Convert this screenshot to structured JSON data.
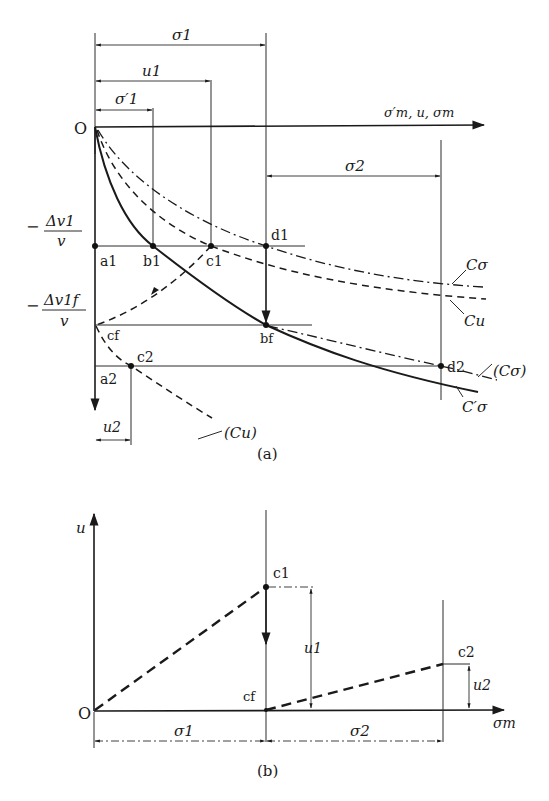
{
  "figure_a": {
    "caption": "(a)",
    "origin_label": "O",
    "x_axis_label": "σ′m, u, σm",
    "dimensions": {
      "sigma1": "σ1",
      "u1": "u1",
      "sigma1_prime": "σ′1",
      "sigma2": "σ2",
      "u2": "u2"
    },
    "y_labels": {
      "dv1_num": "Δv1",
      "dv1_den": "v",
      "dv1f_num": "Δv1f",
      "dv1f_den": "v",
      "minus": "−"
    },
    "points": {
      "a1": "a1",
      "b1": "b1",
      "c1": "c1",
      "d1": "d1",
      "cf": "cf",
      "bf": "bf",
      "a2": "a2",
      "c2": "c2",
      "d2": "d2"
    },
    "curves": {
      "c_sigma": "Cσ",
      "c_u": "Cu",
      "c_sigma_paren": "(Cσ)",
      "c_sigma_prime": "C′σ",
      "c_u_paren": "(Cu)"
    }
  },
  "figure_b": {
    "caption": "(b)",
    "origin_label": "O",
    "y_axis_label": "u",
    "x_axis_label": "σm",
    "points": {
      "c1": "c1",
      "cf": "cf",
      "c2": "c2"
    },
    "dimensions": {
      "sigma1": "σ1",
      "sigma2": "σ2",
      "u1": "u1",
      "u2": "u2"
    }
  }
}
